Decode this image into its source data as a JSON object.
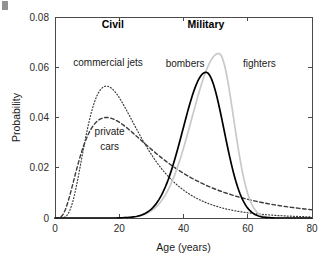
{
  "figure": {
    "width": 333,
    "height": 259,
    "background": "#ffffff"
  },
  "corner_mark": {
    "name": "page-edge-artifact",
    "description": "partial glyph fragment at top-left edge"
  },
  "chart_data": {
    "type": "line",
    "title": "",
    "xlabel": "Age (years)",
    "ylabel": "Probability",
    "xlim": [
      0,
      80
    ],
    "ylim": [
      0,
      0.08
    ],
    "xticks": [
      0,
      20,
      40,
      60,
      80
    ],
    "yticks": [
      0,
      0.02,
      0.04,
      0.06,
      0.08
    ],
    "xtick_labels": [
      "0",
      "20",
      "40",
      "60",
      "80"
    ],
    "ytick_labels": [
      "0",
      "0.02",
      "0.04",
      "0.06",
      "0.08"
    ],
    "grid": false,
    "legend_position": "inline-annotations",
    "group_annotations": [
      {
        "text": "Civil",
        "x": 18,
        "y": 0.0755,
        "bold": true
      },
      {
        "text": "Military",
        "x": 47,
        "y": 0.0755,
        "bold": true
      }
    ],
    "series": [
      {
        "name": "commercial jets",
        "style": "dotted",
        "color": "#3c3c3c",
        "width": 1.2,
        "peak_x": 16,
        "peak_y": 0.0525,
        "shape": "lognormal",
        "sigma": 0.52,
        "label": {
          "text": "commercial jets",
          "x": 16.5,
          "y": 0.0605,
          "anchor": "mid"
        }
      },
      {
        "name": "private cars",
        "style": "dashed",
        "color": "#3c3c3c",
        "width": 1.4,
        "peak_x": 16,
        "peak_y": 0.04,
        "shape": "lognormal",
        "sigma": 0.72,
        "label": {
          "text": "private",
          "x": 17,
          "y": 0.033,
          "anchor": "mid"
        },
        "label2": {
          "text": "cars",
          "x": 17,
          "y": 0.0272,
          "anchor": "mid"
        }
      },
      {
        "name": "bombers",
        "style": "solid",
        "color": "#000000",
        "width": 1.7,
        "peak_x": 47,
        "peak_y": 0.058,
        "shape": "gaussian-skew",
        "sigma_left": 7.2,
        "sigma_right": 5.6,
        "label": {
          "text": "bombers",
          "x": 40.5,
          "y": 0.06,
          "anchor": "mid"
        }
      },
      {
        "name": "fighters",
        "style": "solid",
        "color": "#c9c9c9",
        "width": 1.7,
        "peak_x": 51,
        "peak_y": 0.0655,
        "shape": "gaussian-skew",
        "sigma_left": 8.4,
        "sigma_right": 4.6,
        "label": {
          "text": "fighters",
          "x": 58.5,
          "y": 0.06,
          "anchor": "start"
        }
      }
    ],
    "data_points": {
      "x": [
        0,
        2,
        4,
        6,
        8,
        10,
        12,
        14,
        16,
        18,
        20,
        22,
        24,
        26,
        28,
        30,
        32,
        34,
        36,
        38,
        40,
        42,
        44,
        46,
        48,
        50,
        52,
        54,
        56,
        58,
        60,
        62,
        64,
        66,
        68,
        70,
        72,
        74,
        76,
        78,
        80
      ],
      "commercial jets": [
        0,
        0.0035,
        0.016,
        0.0315,
        0.043,
        0.0495,
        0.0522,
        0.0527,
        0.0525,
        0.05,
        0.046,
        0.0412,
        0.036,
        0.0308,
        0.0258,
        0.0212,
        0.0172,
        0.0138,
        0.011,
        0.0087,
        0.0068,
        0.0053,
        0.0042,
        0.0033,
        0.0026,
        0.002,
        0.0016,
        0.0013,
        0.001,
        0.0008,
        0.0006,
        0.0005,
        0.0004,
        0.0003,
        0.0002,
        0.0002,
        0.0001,
        0.0001,
        0.0001,
        0.0,
        0.0
      ],
      "private cars": [
        0,
        0.005,
        0.015,
        0.025,
        0.032,
        0.0365,
        0.039,
        0.0399,
        0.04,
        0.0393,
        0.038,
        0.0362,
        0.0341,
        0.0318,
        0.0294,
        0.027,
        0.0246,
        0.0223,
        0.0201,
        0.018,
        0.0161,
        0.0144,
        0.0128,
        0.0114,
        0.0101,
        0.0089,
        0.0079,
        0.007,
        0.0062,
        0.0055,
        0.0048,
        0.0043,
        0.0038,
        0.0034,
        0.003,
        0.0026,
        0.0023,
        0.0021,
        0.0018,
        0.0016,
        0.0014
      ],
      "bombers": [
        0,
        0,
        0,
        0,
        0,
        0.0001,
        0.0002,
        0.0004,
        0.0008,
        0.0014,
        0.0024,
        0.004,
        0.0063,
        0.0096,
        0.0139,
        0.0194,
        0.0259,
        0.0331,
        0.0405,
        0.0474,
        0.053,
        0.0567,
        0.058,
        0.058,
        0.0563,
        0.0518,
        0.045,
        0.0368,
        0.0283,
        0.0203,
        0.0135,
        0.0082,
        0.0045,
        0.0022,
        0.0009,
        0.0003,
        0.0001,
        0.0,
        0.0,
        0.0,
        0.0
      ],
      "fighters": [
        0,
        0,
        0,
        0,
        0,
        0,
        0.0001,
        0.0002,
        0.0004,
        0.0007,
        0.0013,
        0.0022,
        0.0036,
        0.0056,
        0.0084,
        0.0121,
        0.0167,
        0.0222,
        0.0284,
        0.035,
        0.0417,
        0.048,
        0.0554,
        0.0614,
        0.065,
        0.0655,
        0.0628,
        0.056,
        0.0463,
        0.0352,
        0.0245,
        0.0154,
        0.0087,
        0.0043,
        0.0018,
        0.0007,
        0.0002,
        0.0,
        0.0,
        0.0,
        0.0
      ]
    }
  }
}
